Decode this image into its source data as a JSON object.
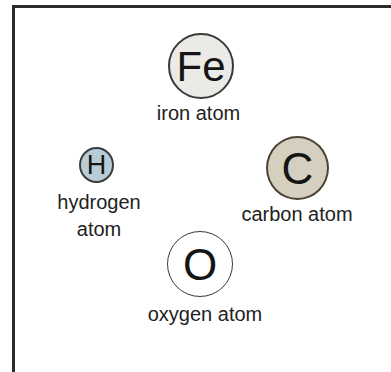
{
  "diagram": {
    "atoms": [
      {
        "symbol": "Fe",
        "label": "iron atom",
        "fill": "#ebeae6"
      },
      {
        "symbol": "H",
        "label_line1": "hydrogen",
        "label_line2": "atom",
        "fill": "#b8ccd6"
      },
      {
        "symbol": "C",
        "label": "carbon atom",
        "fill": "#d5cfbf"
      },
      {
        "symbol": "O",
        "label": "oxygen atom",
        "fill": "#ffffff"
      }
    ],
    "frame_color": "#2a2a2a"
  }
}
